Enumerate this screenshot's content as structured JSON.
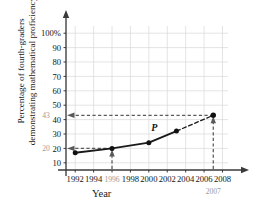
{
  "chart_data": {
    "type": "line",
    "title": "",
    "xlabel": "Year",
    "ylabel_line1": "Percentage of fourth-graders",
    "ylabel_line2": "demonstrating mathematical proficiency",
    "xlim": [
      1991,
      2008.6
    ],
    "ylim": [
      5,
      105
    ],
    "grid": true,
    "legend": null,
    "x": [
      1992,
      1996,
      2000,
      2003
    ],
    "values": [
      17,
      20,
      24,
      32
    ],
    "series": [
      {
        "name": "P",
        "style": "solid",
        "x": [
          1992,
          1996,
          2000,
          2003
        ],
        "values": [
          17,
          20,
          24,
          32
        ]
      },
      {
        "name": "P-extrapolated",
        "style": "dashed",
        "x": [
          2003,
          2007
        ],
        "values": [
          32,
          43
        ]
      }
    ],
    "xticks": [
      1992,
      1994,
      1996,
      1998,
      2000,
      2002,
      2004,
      2006,
      2008
    ],
    "xticklabels": [
      "1992",
      "1994",
      "1996",
      "1998",
      "2000",
      "2002",
      "2004",
      "2006",
      "2008"
    ],
    "yticks": [
      10,
      20,
      30,
      40,
      50,
      60,
      70,
      80,
      90,
      100
    ],
    "yticklabels": [
      "10",
      "20",
      "30",
      "40",
      "50",
      "60",
      "70",
      "80",
      "90",
      "100%"
    ],
    "curve_label": "P",
    "annotations": [
      {
        "name": "y-annotation-43",
        "text": "43",
        "value": 43,
        "axis": "y",
        "color": "#9a9a9a"
      },
      {
        "name": "y-annotation-20",
        "text": "20",
        "value": 20,
        "axis": "y",
        "color": "#9a9a9a"
      },
      {
        "name": "x-annotation-1996",
        "text": "1996",
        "value": 1996,
        "axis": "x",
        "color": "#9a9a9a"
      },
      {
        "name": "x-annotation-2007",
        "text": "2007",
        "value": 2007,
        "axis": "x",
        "color": "#555555"
      }
    ],
    "guide_lines": [
      {
        "name": "guide-2007-to-43",
        "from": [
          2007,
          5
        ],
        "to": [
          2007,
          43
        ],
        "to_y_axis": 43
      },
      {
        "name": "guide-1996-to-20",
        "from": [
          1996,
          5
        ],
        "to": [
          1996,
          20
        ],
        "to_y_axis": 20
      }
    ],
    "colors": {
      "line": "#1a1a1a",
      "grid": "#d9d9d9",
      "axis": "#3a3a3a",
      "guide": "#5a5a5a",
      "annotation_gray": "#9a9a9a"
    }
  }
}
